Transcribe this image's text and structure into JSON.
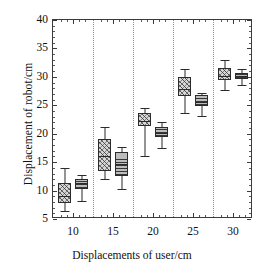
{
  "chart_data": {
    "type": "box",
    "title": "",
    "xlabel": "Displacements of user/cm",
    "ylabel": "Displacement of robot/cm",
    "xtick_labels": [
      "10",
      "15",
      "20",
      "25",
      "30"
    ],
    "ytick_labels": [
      "5",
      "10",
      "15",
      "20",
      "25",
      "30",
      "35",
      "40"
    ],
    "ylim": [
      5,
      40
    ],
    "grid": "vertical dotted separators between groups",
    "legend": "none",
    "categories": [
      10,
      15,
      20,
      25,
      30
    ],
    "series": [
      {
        "name": "series-a",
        "fill": "diagonal-crosshatch",
        "boxes": [
          {
            "category": 10,
            "whisker_low": 6.4,
            "q1": 7.8,
            "median": 9.0,
            "q3": 11.3,
            "whisker_high": 13.9
          },
          {
            "category": 15,
            "whisker_low": 12.1,
            "q1": 13.5,
            "median": 16.1,
            "q3": 19.0,
            "whisker_high": 21.2
          },
          {
            "category": 20,
            "whisker_low": 16.1,
            "q1": 21.3,
            "median": 22.3,
            "q3": 23.7,
            "whisker_high": 24.5
          },
          {
            "category": 25,
            "whisker_low": 23.6,
            "q1": 26.6,
            "median": 27.9,
            "q3": 30.0,
            "whisker_high": 31.4
          },
          {
            "category": 30,
            "whisker_low": 27.7,
            "q1": 29.4,
            "median": 30.2,
            "q3": 31.6,
            "whisker_high": 32.9
          }
        ]
      },
      {
        "name": "series-b",
        "fill": "horizontal-lines",
        "boxes": [
          {
            "category": 10,
            "whisker_low": 8.1,
            "q1": 10.2,
            "median": 11.3,
            "q3": 12.0,
            "whisker_high": 12.8
          },
          {
            "category": 15,
            "whisker_low": 10.3,
            "q1": 12.6,
            "median": 14.7,
            "q3": 16.8,
            "whisker_high": 17.7
          },
          {
            "category": 20,
            "whisker_low": 17.5,
            "q1": 19.5,
            "median": 20.2,
            "q3": 21.1,
            "whisker_high": 22.1
          },
          {
            "category": 25,
            "whisker_low": 23.2,
            "q1": 24.9,
            "median": 25.6,
            "q3": 26.8,
            "whisker_high": 27.2
          },
          {
            "category": 30,
            "whisker_low": 28.6,
            "q1": 29.7,
            "median": 30.2,
            "q3": 30.7,
            "whisker_high": 31.4
          }
        ]
      }
    ],
    "colors": {
      "line": "#2b2b2b",
      "box_fill_a": "#d6d6d6",
      "box_fill_b": "#bdbdbd",
      "gridline": "#8a8a8a",
      "background": "#ffffff"
    }
  }
}
